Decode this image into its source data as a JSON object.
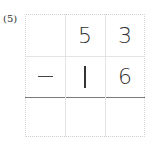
{
  "problem": {
    "label": "(5)",
    "operator": "−",
    "minuend": [
      "5",
      "3"
    ],
    "subtrahend": [
      "1",
      "6"
    ],
    "answer": [
      "",
      "",
      ""
    ]
  },
  "grid": {
    "rows": 3,
    "columns": 3
  }
}
